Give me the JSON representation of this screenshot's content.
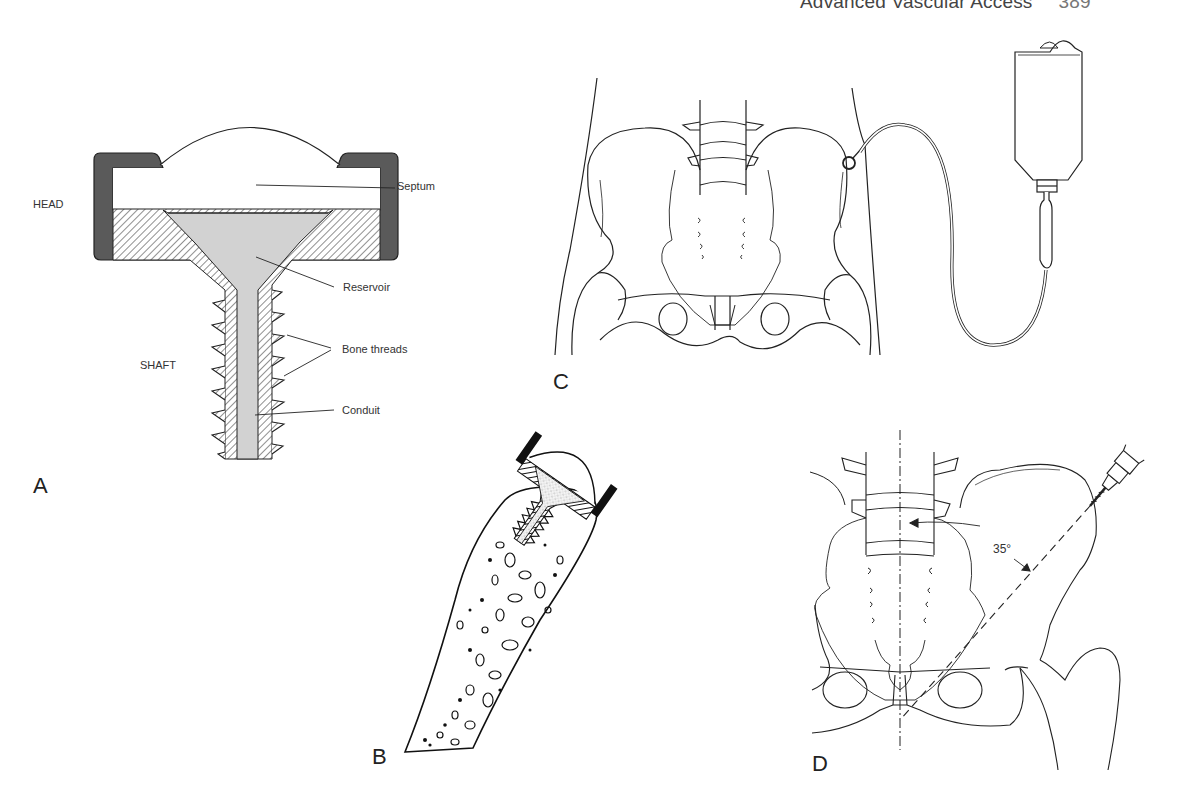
{
  "running_head": {
    "title": "Advanced Vascular Access",
    "page_number": "389"
  },
  "panels": {
    "A": {
      "letter": "A",
      "description": "Cross-section of intraosseous infusion device",
      "section_labels": {
        "head": "HEAD",
        "shaft": "SHAFT"
      },
      "callouts": {
        "septum": "Septum",
        "reservoir": "Reservoir",
        "bone_threads": "Bone threads",
        "conduit": "Conduit"
      }
    },
    "B": {
      "letter": "B",
      "description": "Device threaded into cancellous bone"
    },
    "C": {
      "letter": "C",
      "description": "Device in iliac crest connected to IV bag via tubing"
    },
    "D": {
      "letter": "D",
      "description": "Insertion angle relative to midline",
      "angle_label": "35°"
    }
  },
  "colors": {
    "ink": "#1e1e1e",
    "cap_fill": "#5a5a5a",
    "reservoir_fill": "#d2d2d2",
    "paper": "#ffffff"
  }
}
